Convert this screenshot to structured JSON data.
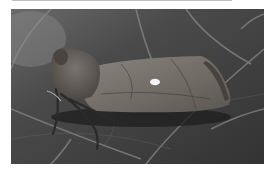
{
  "image": {
    "subject": "moth resting on a leaf",
    "alt": "Close-up photograph of a brown moth with a small white spot on its forewing, perched on a veined leaf",
    "palette": {
      "leaf_dark": "#3a3a3a",
      "leaf_mid": "#565656",
      "vein_light": "#8a8a8a",
      "moth_body": "#6a6460",
      "moth_wing": "#7a7470",
      "wing_shadow": "#2a2a2a",
      "white_spot": "#f4f4f4",
      "margin": "#ffffff"
    }
  }
}
